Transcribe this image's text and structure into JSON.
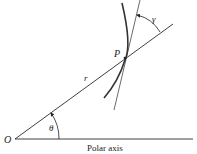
{
  "diagram": {
    "labels": {
      "origin": "O",
      "point": "P",
      "radius": "r",
      "theta": "θ",
      "gamma": "γ",
      "axis": "Polar axis"
    },
    "colors": {
      "line": "#2a2a2a",
      "curve": "#333333",
      "text": "#222222"
    }
  }
}
